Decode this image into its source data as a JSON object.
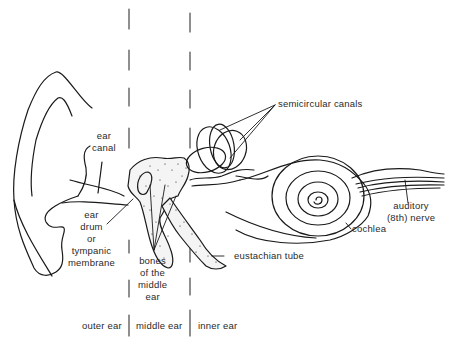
{
  "diagram": {
    "colors": {
      "ink": "#1a1a1a",
      "text": "#2a2a2a",
      "background": "#ffffff"
    },
    "labels": {
      "ear_canal": [
        "ear",
        "canal"
      ],
      "ear_drum": [
        "ear",
        "drum",
        "or",
        "tympanic",
        "membrane"
      ],
      "bones": [
        "bones",
        "of the",
        "middle",
        "ear"
      ],
      "semicircular_canals": "semicircular canals",
      "auditory_nerve": [
        "auditory",
        "(8th) nerve"
      ],
      "cochlea": "cochlea",
      "eustachian_tube": "eustachian tube"
    },
    "regions": {
      "outer": "outer ear",
      "middle": "middle ear",
      "inner": "inner ear"
    }
  }
}
